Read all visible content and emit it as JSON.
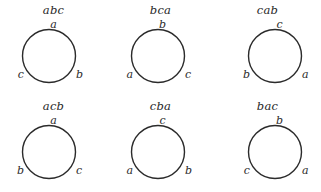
{
  "figure": {
    "type": "permutation-circle-diagrams",
    "rows": 2,
    "columns": 3,
    "background_color": "#ffffff",
    "stroke_color": "#2b2b2b",
    "text_color": "#272727",
    "cells": [
      {
        "title": "abc",
        "top_label": "a",
        "left_label": "c",
        "right_label": "b"
      },
      {
        "title": "bca",
        "top_label": "b",
        "left_label": "a",
        "right_label": "c"
      },
      {
        "title": "cab",
        "top_label": "c",
        "left_label": "b",
        "right_label": "a"
      },
      {
        "title": "acb",
        "top_label": "a",
        "left_label": "b",
        "right_label": "c"
      },
      {
        "title": "cba",
        "top_label": "c",
        "left_label": "a",
        "right_label": "b"
      },
      {
        "title": "bac",
        "top_label": "b",
        "left_label": "c",
        "right_label": "a"
      }
    ]
  }
}
